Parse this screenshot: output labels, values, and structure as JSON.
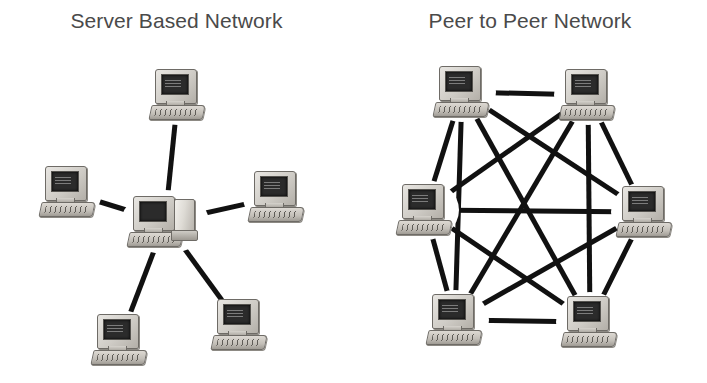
{
  "page": {
    "background_color": "#ffffff",
    "width": 707,
    "height": 383
  },
  "style": {
    "line_color": "#111111",
    "line_width": 5,
    "title_color": "#4a4a4a",
    "monitor_color": "#cfccc6",
    "screen_color": "#2b2b2b"
  },
  "diagrams": [
    {
      "id": "server-based-network",
      "title": "Server Based Network",
      "topology": "star",
      "node_count": 6,
      "link_count": 5,
      "nodes": [
        {
          "id": "server",
          "label": "server",
          "role": "server",
          "icon": "server-computer-icon",
          "x": 165,
          "y": 222
        },
        {
          "id": "client-top",
          "label": "client",
          "role": "client",
          "icon": "computer-icon",
          "x": 178,
          "y": 95
        },
        {
          "id": "client-upper-left",
          "label": "client",
          "role": "client",
          "icon": "computer-icon",
          "x": 68,
          "y": 192
        },
        {
          "id": "client-upper-right",
          "label": "client",
          "role": "client",
          "icon": "computer-icon",
          "x": 277,
          "y": 197
        },
        {
          "id": "client-lower-left",
          "label": "client",
          "role": "client",
          "icon": "computer-icon",
          "x": 120,
          "y": 340
        },
        {
          "id": "client-lower-right",
          "label": "client",
          "role": "client",
          "icon": "computer-icon",
          "x": 240,
          "y": 325
        }
      ],
      "links": [
        {
          "from": "server",
          "to": "client-top"
        },
        {
          "from": "server",
          "to": "client-upper-left"
        },
        {
          "from": "server",
          "to": "client-upper-right"
        },
        {
          "from": "server",
          "to": "client-lower-left"
        },
        {
          "from": "server",
          "to": "client-lower-right"
        }
      ]
    },
    {
      "id": "peer-to-peer-network",
      "title": "Peer to Peer Network",
      "topology": "full-mesh",
      "node_count": 6,
      "link_count": 15,
      "nodes": [
        {
          "id": "peer-top-left",
          "label": "peer",
          "role": "peer",
          "icon": "computer-icon",
          "x": 462,
          "y": 92
        },
        {
          "id": "peer-top-right",
          "label": "peer",
          "role": "peer",
          "icon": "computer-icon",
          "x": 588,
          "y": 95
        },
        {
          "id": "peer-mid-left",
          "label": "peer",
          "role": "peer",
          "icon": "computer-icon",
          "x": 425,
          "y": 210
        },
        {
          "id": "peer-mid-right",
          "label": "peer",
          "role": "peer",
          "icon": "computer-icon",
          "x": 645,
          "y": 212
        },
        {
          "id": "peer-bottom-left",
          "label": "peer",
          "role": "peer",
          "icon": "computer-icon",
          "x": 455,
          "y": 320
        },
        {
          "id": "peer-bottom-right",
          "label": "peer",
          "role": "peer",
          "icon": "computer-icon",
          "x": 590,
          "y": 322
        }
      ],
      "links": [
        {
          "from": "peer-top-left",
          "to": "peer-top-right"
        },
        {
          "from": "peer-top-left",
          "to": "peer-mid-left"
        },
        {
          "from": "peer-top-left",
          "to": "peer-mid-right"
        },
        {
          "from": "peer-top-left",
          "to": "peer-bottom-left"
        },
        {
          "from": "peer-top-left",
          "to": "peer-bottom-right"
        },
        {
          "from": "peer-top-right",
          "to": "peer-mid-left"
        },
        {
          "from": "peer-top-right",
          "to": "peer-mid-right"
        },
        {
          "from": "peer-top-right",
          "to": "peer-bottom-left"
        },
        {
          "from": "peer-top-right",
          "to": "peer-bottom-right"
        },
        {
          "from": "peer-mid-left",
          "to": "peer-mid-right"
        },
        {
          "from": "peer-mid-left",
          "to": "peer-bottom-left"
        },
        {
          "from": "peer-mid-left",
          "to": "peer-bottom-right"
        },
        {
          "from": "peer-mid-right",
          "to": "peer-bottom-left"
        },
        {
          "from": "peer-mid-right",
          "to": "peer-bottom-right"
        },
        {
          "from": "peer-bottom-left",
          "to": "peer-bottom-right"
        }
      ]
    }
  ]
}
